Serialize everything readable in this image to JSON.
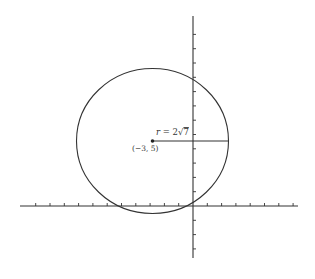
{
  "figure": {
    "type": "circle-on-coordinate-plane",
    "center_label": "(−3, 5)",
    "radius_label_prefix": "r = 2",
    "radius_label_radicand": "7",
    "center": {
      "x": -3,
      "y": 5
    },
    "radius_exact": "2√7",
    "radius_approx": 5.29,
    "x_range": [
      -12,
      7
    ],
    "y_range": [
      -3.5,
      13
    ],
    "tick_spacing": 1
  },
  "colors": {
    "stroke": "#333333",
    "text": "#333333",
    "background": "#ffffff"
  }
}
